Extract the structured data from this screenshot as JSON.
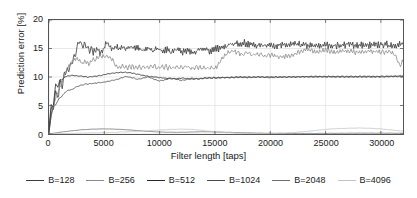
{
  "chart_data": {
    "type": "line",
    "title": "",
    "xlabel": "Filter length [taps]",
    "ylabel": "Prediction error [%]",
    "xlim": [
      0,
      32000
    ],
    "ylim": [
      0,
      20
    ],
    "xticks": [
      0,
      5000,
      10000,
      15000,
      20000,
      25000,
      30000
    ],
    "xtick_labels": [
      "0",
      "5000",
      "10000",
      "15000",
      "20000",
      "25000",
      "30000"
    ],
    "yticks": [
      0,
      5,
      10,
      15,
      20
    ],
    "ytick_labels": [
      "0",
      "5",
      "10",
      "15",
      "20"
    ],
    "grid": true,
    "legend_position": "bottom",
    "series": [
      {
        "name": "B=128",
        "color": "#3a3a3a",
        "x": [
          0,
          200,
          400,
          600,
          800,
          1000,
          1200,
          1400,
          1600,
          1800,
          2000,
          2200,
          2400,
          2600,
          2800,
          3000,
          3200,
          3400,
          3600,
          3800,
          4000,
          4300,
          4600,
          4900,
          5200,
          5500,
          5800,
          6100,
          6400,
          6700,
          7000,
          7400,
          7800,
          8200,
          8600,
          9000,
          9400,
          9800,
          10200,
          10600,
          11000,
          11500,
          12000,
          12500,
          13000,
          13500,
          14000,
          14500,
          15000,
          15500,
          16000,
          16500,
          17000,
          17500,
          18000,
          18500,
          19000,
          19500,
          20000,
          21000,
          22000,
          23000,
          24000,
          25000,
          26000,
          27000,
          28000,
          29000,
          30000,
          31000,
          32000
        ],
        "y": [
          1.0,
          5.2,
          4.3,
          7.6,
          6.4,
          9.2,
          8.3,
          10.6,
          10.9,
          11.4,
          12.2,
          13.1,
          13.9,
          15.6,
          16.2,
          15.4,
          15.9,
          15.3,
          14.6,
          15.1,
          14.4,
          14.9,
          14.3,
          14.8,
          16.1,
          15.2,
          14.8,
          15.4,
          14.9,
          15.3,
          15.0,
          15.4,
          14.8,
          15.2,
          14.7,
          15.1,
          14.6,
          15.0,
          14.5,
          14.9,
          14.4,
          14.8,
          14.3,
          14.7,
          14.2,
          14.6,
          15.0,
          14.5,
          14.9,
          15.2,
          15.4,
          15.6,
          15.9,
          16.0,
          15.8,
          15.6,
          15.5,
          15.7,
          15.6,
          15.5,
          15.7,
          15.6,
          15.4,
          15.6,
          15.5,
          15.7,
          15.6,
          15.5,
          15.7,
          15.6,
          15.7
        ]
      },
      {
        "name": "B=256",
        "color": "#8a8a8a",
        "x": [
          0,
          200,
          400,
          600,
          800,
          1000,
          1200,
          1400,
          1600,
          1800,
          2000,
          2200,
          2400,
          2700,
          3000,
          3300,
          3600,
          4000,
          4400,
          4800,
          5200,
          5600,
          6000,
          6400,
          6800,
          7200,
          7600,
          8000,
          8500,
          9000,
          9500,
          10000,
          10500,
          11000,
          11500,
          12000,
          12500,
          13000,
          13500,
          14000,
          14500,
          15000,
          15400,
          15800,
          16200,
          16600,
          17000,
          17500,
          18000,
          18500,
          19000,
          19500,
          20000,
          21000,
          22000,
          22800,
          23400,
          24000,
          25000,
          26000,
          27000,
          28000,
          29000,
          30000,
          30800,
          31300,
          31700,
          32000
        ],
        "y": [
          0.6,
          3.1,
          5.0,
          6.2,
          7.3,
          8.4,
          9.3,
          10.2,
          11.1,
          12.0,
          12.6,
          12.9,
          13.2,
          13.0,
          12.4,
          12.8,
          12.3,
          13.0,
          13.4,
          13.5,
          13.6,
          13.5,
          12.1,
          11.8,
          11.9,
          11.7,
          11.8,
          11.6,
          11.8,
          11.6,
          11.9,
          11.6,
          11.8,
          11.5,
          11.8,
          11.6,
          11.8,
          11.5,
          11.7,
          11.5,
          11.6,
          11.5,
          12.4,
          13.6,
          14.2,
          14.6,
          14.3,
          13.9,
          14.2,
          13.8,
          14.1,
          13.7,
          13.9,
          13.6,
          13.8,
          14.6,
          14.8,
          14.4,
          14.7,
          14.3,
          14.6,
          14.3,
          14.6,
          14.3,
          14.5,
          13.9,
          12.1,
          12.7
        ]
      },
      {
        "name": "B=512",
        "color": "#262626",
        "x": [
          0,
          200,
          400,
          600,
          800,
          1000,
          1200,
          1500,
          1800,
          2100,
          2500,
          3000,
          3500,
          4000,
          4500,
          5000,
          5500,
          6000,
          6500,
          7000,
          7500,
          8000,
          8500,
          9000,
          9500,
          10000,
          10500,
          11000,
          11500,
          12000,
          12500,
          13000,
          14000,
          15000,
          16000,
          17000,
          18000,
          19000,
          20000,
          22000,
          24000,
          26000,
          28000,
          30000,
          32000
        ],
        "y": [
          0.3,
          4.6,
          5.1,
          8.8,
          8.2,
          9.6,
          9.5,
          10.1,
          10.2,
          10.3,
          10.2,
          10.1,
          10.0,
          10.1,
          10.2,
          10.4,
          10.6,
          10.7,
          10.8,
          10.8,
          10.7,
          10.5,
          10.3,
          10.1,
          10.0,
          9.9,
          9.8,
          9.7,
          9.7,
          9.8,
          9.7,
          9.6,
          9.8,
          9.9,
          9.9,
          10.0,
          10.0,
          10.0,
          10.0,
          10.0,
          10.1,
          10.1,
          10.1,
          10.1,
          10.2
        ]
      },
      {
        "name": "B=1024",
        "color": "#4a4a4a",
        "x": [
          0,
          200,
          400,
          600,
          900,
          1200,
          1500,
          1800,
          2100,
          2400,
          2800,
          3200,
          3600,
          4000,
          4500,
          5000,
          5500,
          6000,
          6500,
          7000,
          7500,
          8000,
          8500,
          9000,
          9500,
          10000,
          10500,
          11000,
          11500,
          12000,
          12500,
          13000,
          13500,
          14000,
          15000,
          16000,
          17000,
          18000,
          19000,
          20000,
          21000,
          22000,
          24000,
          26000,
          28000,
          30000,
          32000
        ],
        "y": [
          0.2,
          3.4,
          4.8,
          5.1,
          6.2,
          6.7,
          7.4,
          7.7,
          7.8,
          8.2,
          8.5,
          8.7,
          8.8,
          8.9,
          9.0,
          9.1,
          9.3,
          9.5,
          9.8,
          10.1,
          9.9,
          9.6,
          9.8,
          10.0,
          9.6,
          9.3,
          9.5,
          9.8,
          9.6,
          9.4,
          9.6,
          9.8,
          9.6,
          9.8,
          9.8,
          9.9,
          9.9,
          9.9,
          10.0,
          9.9,
          10.0,
          10.0,
          10.0,
          10.0,
          10.0,
          10.0,
          10.1
        ]
      },
      {
        "name": "B=2048",
        "color": "#6e6e6e",
        "x": [
          0,
          500,
          1000,
          2000,
          3000,
          4000,
          5000,
          6000,
          7000,
          8000,
          9000,
          10000,
          11000,
          12000,
          13000,
          14000,
          15000,
          16000,
          17000,
          18000,
          19000,
          20000,
          22000,
          24000,
          26000,
          28000,
          30000,
          32000
        ],
        "y": [
          0.05,
          0.15,
          0.3,
          0.55,
          0.75,
          0.85,
          0.9,
          0.85,
          0.75,
          0.6,
          0.45,
          0.35,
          0.3,
          0.3,
          0.35,
          0.4,
          0.35,
          0.3,
          0.25,
          0.2,
          0.15,
          0.12,
          0.1,
          0.1,
          0.12,
          0.15,
          0.15,
          0.12
        ]
      },
      {
        "name": "B=4096",
        "color": "#c2c2c2",
        "x": [
          0,
          1000,
          2000,
          4000,
          6000,
          8000,
          10000,
          11000,
          12000,
          13000,
          14000,
          15000,
          16000,
          17000,
          18000,
          19000,
          20000,
          21000,
          22000,
          23000,
          24000,
          25000,
          26000,
          27000,
          28000,
          29000,
          30000,
          31000,
          32000
        ],
        "y": [
          0.02,
          0.05,
          0.1,
          0.2,
          0.3,
          0.45,
          0.7,
          0.8,
          0.85,
          0.8,
          0.6,
          0.4,
          0.25,
          0.15,
          0.1,
          0.08,
          0.1,
          0.15,
          0.25,
          0.4,
          0.6,
          0.8,
          0.95,
          1.0,
          1.05,
          1.0,
          0.9,
          0.7,
          0.5
        ]
      }
    ]
  },
  "axis": {
    "ylabel": "Prediction error [%]",
    "xlabel": "Filter length [taps]"
  },
  "legend": {
    "items": [
      {
        "label": "B=128",
        "color": "#3a3a3a"
      },
      {
        "label": "B=256",
        "color": "#8a8a8a"
      },
      {
        "label": "B=512",
        "color": "#262626"
      },
      {
        "label": "B=1024",
        "color": "#4a4a4a"
      },
      {
        "label": "B=2048",
        "color": "#6e6e6e"
      },
      {
        "label": "B=4096",
        "color": "#c2c2c2"
      }
    ]
  },
  "colors": {
    "frame": "#555555",
    "grid": "#d9d9d9",
    "text": "#1a1a1a",
    "background": "#ffffff"
  }
}
